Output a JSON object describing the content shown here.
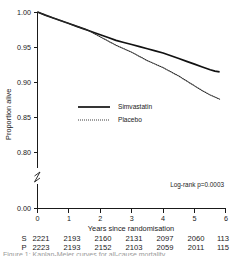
{
  "chart_data": {
    "type": "line",
    "title": "",
    "xlabel": "Years since randomisation",
    "ylabel": "Proportion alive",
    "xlim": [
      0,
      6
    ],
    "ylim": [
      0.775,
      1.0
    ],
    "y_axis_break": true,
    "y_break_label": "0.00",
    "xticks": [
      "0",
      "1",
      "2",
      "3",
      "4",
      "5",
      "6"
    ],
    "xtick_values": [
      0,
      1,
      2,
      3,
      4,
      5,
      6
    ],
    "yticks": [
      "1.00",
      "0.95",
      "0.90",
      "0.85",
      "0.80",
      "0.00"
    ],
    "ytick_values": [
      1.0,
      0.95,
      0.9,
      0.85,
      0.8,
      0.0
    ],
    "grid": false,
    "legend_position": "center-left",
    "annotation": "Log-rank p=0.0003",
    "series": [
      {
        "name": "Simvastatin",
        "style": "solid",
        "color": "#111111",
        "x": [
          0,
          0.25,
          0.5,
          0.75,
          1.0,
          1.25,
          1.5,
          1.6,
          1.75,
          2.0,
          2.25,
          2.5,
          2.75,
          3.0,
          3.25,
          3.5,
          3.75,
          4.0,
          4.25,
          4.5,
          4.75,
          5.0,
          5.25,
          5.5,
          5.65,
          5.8
        ],
        "y": [
          1.0,
          0.9955,
          0.9915,
          0.9875,
          0.9835,
          0.9795,
          0.9755,
          0.974,
          0.9715,
          0.9675,
          0.9635,
          0.9595,
          0.9565,
          0.9535,
          0.9505,
          0.9475,
          0.9445,
          0.9415,
          0.9375,
          0.9335,
          0.9295,
          0.9255,
          0.9215,
          0.9175,
          0.9155,
          0.9145
        ]
      },
      {
        "name": "Placebo",
        "style": "dotted",
        "color": "#2a2a2a",
        "x": [
          0,
          0.25,
          0.5,
          0.75,
          1.0,
          1.25,
          1.5,
          1.6,
          1.75,
          2.0,
          2.25,
          2.5,
          2.75,
          3.0,
          3.25,
          3.5,
          3.75,
          4.0,
          4.25,
          4.5,
          4.75,
          5.0,
          5.25,
          5.5,
          5.65,
          5.8
        ],
        "y": [
          1.0,
          0.9955,
          0.9915,
          0.9875,
          0.9835,
          0.9795,
          0.9755,
          0.974,
          0.9705,
          0.9645,
          0.9585,
          0.9525,
          0.9475,
          0.9425,
          0.9365,
          0.9305,
          0.9255,
          0.9205,
          0.9145,
          0.9085,
          0.9015,
          0.8945,
          0.8875,
          0.8815,
          0.8785,
          0.8755
        ]
      }
    ]
  },
  "legend": {
    "entries": [
      {
        "label": "Simvastatin",
        "style": "solid"
      },
      {
        "label": "Placebo",
        "style": "dotted"
      }
    ]
  },
  "risk_table": {
    "rows": [
      {
        "group": "S",
        "values": [
          "2221",
          "2193",
          "2160",
          "2131",
          "2097",
          "2060",
          "113"
        ]
      },
      {
        "group": "P",
        "values": [
          "2223",
          "2193",
          "2152",
          "2103",
          "2059",
          "2011",
          "115"
        ]
      }
    ]
  },
  "caption": {
    "text": "Figure 1: Kaplan-Meier curves for all-cause mortality"
  }
}
